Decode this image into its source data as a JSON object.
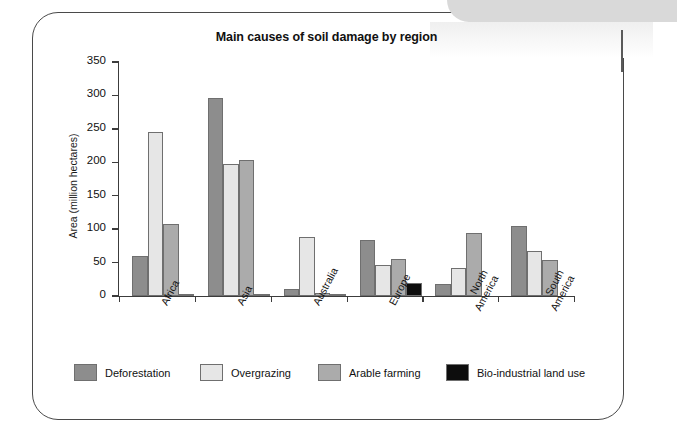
{
  "chart_data": {
    "type": "bar",
    "title": "Main causes of soil damage by region",
    "xlabel": "",
    "ylabel": "Area (million hectares)",
    "ylim": [
      0,
      350
    ],
    "yticks": [
      0,
      50,
      100,
      150,
      200,
      250,
      300,
      350
    ],
    "ytick_labels": [
      "0",
      "50",
      "100",
      "150",
      "200",
      "250",
      "300",
      "350"
    ],
    "grid": false,
    "legend_position": "bottom",
    "categories": [
      "Africa",
      "Asia",
      "Australia",
      "Europe",
      "North America",
      "South America"
    ],
    "category_label_lines": [
      [
        "Africa"
      ],
      [
        "Asia"
      ],
      [
        "Australia"
      ],
      [
        "Europe"
      ],
      [
        "North",
        "America"
      ],
      [
        "South",
        "America"
      ]
    ],
    "series": [
      {
        "name": "Deforestation",
        "color": "#8d8d8d",
        "values": [
          60,
          296,
          11,
          84,
          18,
          105
        ]
      },
      {
        "name": "Overgrazing",
        "color": "#e6e6e6",
        "values": [
          245,
          197,
          89,
          47,
          42,
          68
        ]
      },
      {
        "name": "Arable farming",
        "color": "#ababab",
        "values": [
          108,
          204,
          5,
          56,
          95,
          54
        ]
      },
      {
        "name": "Bio-industrial land use",
        "color": "#0d0d0d",
        "values": [
          3,
          3,
          0.5,
          20,
          0,
          0
        ]
      }
    ]
  },
  "legend": {
    "items": [
      {
        "label": "Deforestation",
        "color": "#8d8d8d"
      },
      {
        "label": "Overgrazing",
        "color": "#e6e6e6"
      },
      {
        "label": "Arable farming",
        "color": "#ababab"
      },
      {
        "label": "Bio-industrial land use",
        "color": "#0d0d0d"
      }
    ]
  },
  "layout": {
    "legend_item_x": [
      0,
      126,
      244,
      372
    ]
  }
}
